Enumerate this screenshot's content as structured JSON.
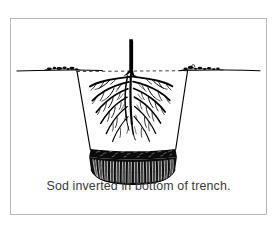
{
  "figure": {
    "caption": "Sod inverted in bottom of trench.",
    "frame": {
      "border_color": "#b9b9b9",
      "background_color": "#ffffff"
    },
    "ink_color": "#000000",
    "caption_color": "#3a3a3a",
    "parts": {
      "ground_line_label": "ground line",
      "grade_dashed_line_label": "original grade line across trench",
      "trunk_label": "tree trunk",
      "root_system_label": "root system",
      "trench_wall_left_label": "left trench wall",
      "trench_wall_right_label": "right trench wall",
      "sod_soil_band_label": "inverted sod soil layer",
      "sod_grass_label": "inverted sod grass blades",
      "surface_clumps_label": "soil clumps on ground surface"
    }
  }
}
